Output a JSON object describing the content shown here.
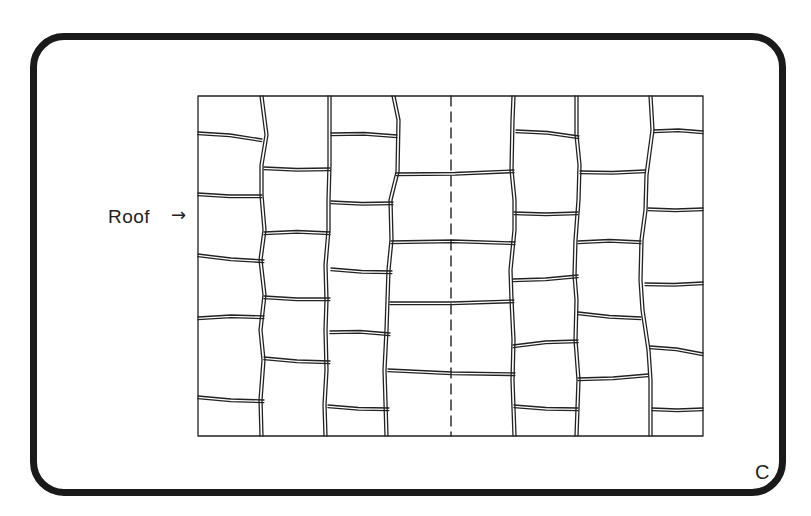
{
  "figure": {
    "label": "Roof",
    "arrow": "→",
    "card_letter": "C",
    "ink_color": "#222222",
    "card_border_color": "#1a1a1a",
    "background_color": "#ffffff",
    "tile_columns": 8,
    "has_center_dashed_line": true
  }
}
